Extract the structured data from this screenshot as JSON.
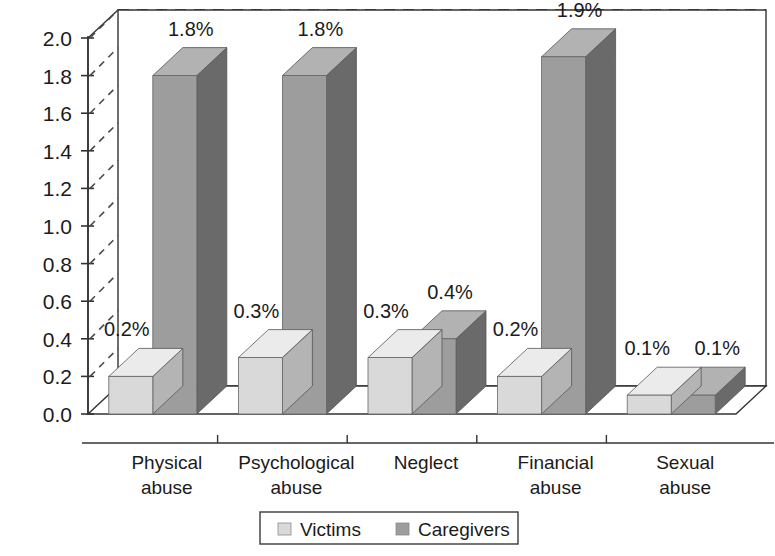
{
  "chart_data": {
    "type": "bar",
    "title": "",
    "subtitle": "",
    "xlabel": "",
    "ylabel": "",
    "categories": [
      "Physical\nabuse",
      "Psychological\nabuse",
      "Neglect",
      "Financial\nabuse",
      "Sexual\nabuse"
    ],
    "category_lines": [
      [
        "Physical",
        "abuse"
      ],
      [
        "Psychological",
        "abuse"
      ],
      [
        "Neglect",
        ""
      ],
      [
        "Financial",
        "abuse"
      ],
      [
        "Sexual",
        "abuse"
      ]
    ],
    "series": [
      {
        "name": "Victims",
        "color": "#d9d9d9",
        "values": [
          0.2,
          0.3,
          0.3,
          0.2,
          0.1
        ],
        "labels": [
          "0.2%",
          "0.3%",
          "0.3%",
          "0.2%",
          "0.1%"
        ]
      },
      {
        "name": "Caregivers",
        "color": "#9d9d9d",
        "values": [
          1.8,
          1.8,
          0.4,
          1.9,
          0.1
        ],
        "labels": [
          "1.8%",
          "1.8%",
          "0.4%",
          "1.9%",
          "0.1%"
        ]
      }
    ],
    "ylim": [
      0.0,
      2.0
    ],
    "ytick_step": 0.2,
    "ytick_labels": [
      "0.0",
      "0.2",
      "0.4",
      "0.6",
      "0.8",
      "1.0",
      "1.2",
      "1.4",
      "1.6",
      "1.8",
      "2.0"
    ],
    "grid": true,
    "grid_style": "dashed",
    "legend_position": "bottom",
    "style": "3d-clustered-column",
    "value_labels_shown": true
  },
  "legend": {
    "items": [
      {
        "label": "Victims",
        "swatch_color": "#d9d9d9"
      },
      {
        "label": "Caregivers",
        "swatch_color": "#9d9d9d"
      }
    ]
  },
  "colors": {
    "victims_front": "#d9d9d9",
    "victims_top": "#ebebeb",
    "victims_side": "#b4b4b4",
    "caregivers_front": "#9d9d9d",
    "caregivers_top": "#b2b2b2",
    "caregivers_side": "#6a6a6a",
    "axis": "#333333",
    "grid": "#4a4a4a",
    "text": "#1b1b1b",
    "background": "#ffffff"
  }
}
